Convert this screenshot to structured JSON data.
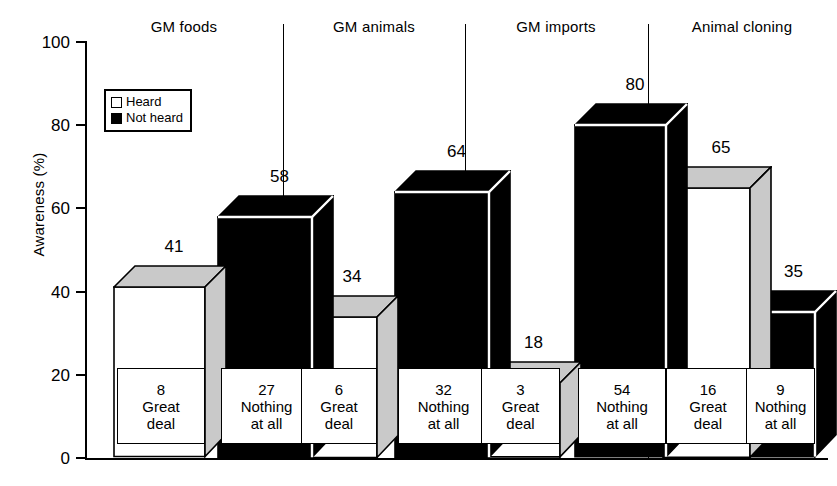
{
  "chart_data": {
    "type": "bar",
    "title": "",
    "xlabel": "",
    "ylabel": "Awareness (%)",
    "ylim": [
      0,
      100
    ],
    "yticks": [
      0,
      20,
      40,
      60,
      80,
      100
    ],
    "grid": false,
    "legend_position": "top-left",
    "style": "3d-bars",
    "legend": [
      {
        "key": "heard",
        "label": "Heard",
        "color": "#ffffff"
      },
      {
        "key": "notheard",
        "label": "Not heard",
        "color": "#000000"
      }
    ],
    "categories": [
      "GM foods",
      "GM animals",
      "GM imports",
      "Animal cloning"
    ],
    "series": [
      {
        "name": "Heard",
        "values": [
          41,
          34,
          18,
          65
        ]
      },
      {
        "name": "Not heard",
        "values": [
          58,
          64,
          80,
          35
        ]
      }
    ],
    "inner_labels": [
      {
        "value": 8,
        "line1": "Great",
        "line2": "deal"
      },
      {
        "value": 27,
        "line1": "Nothing",
        "line2": "at all"
      },
      {
        "value": 6,
        "line1": "Great",
        "line2": "deal"
      },
      {
        "value": 32,
        "line1": "Nothing",
        "line2": "at all"
      },
      {
        "value": 3,
        "line1": "Great",
        "line2": "deal"
      },
      {
        "value": 54,
        "line1": "Nothing",
        "line2": "at all"
      },
      {
        "value": 16,
        "line1": "Great",
        "line2": "deal"
      },
      {
        "value": 9,
        "line1": "Nothing",
        "line2": "at all"
      }
    ]
  },
  "axis": {
    "y_title": "Awareness (%)",
    "ticks": [
      "100",
      "80",
      "60",
      "40",
      "20",
      "0"
    ]
  },
  "groups": [
    {
      "title": "GM foods"
    },
    {
      "title": "GM animals"
    },
    {
      "title": "GM imports"
    },
    {
      "title": "Animal cloning"
    }
  ],
  "bar_values": {
    "b0": "41",
    "b1": "58",
    "b2": "34",
    "b3": "64",
    "b4": "18",
    "b5": "80",
    "b6": "65",
    "b7": "35"
  },
  "inner": {
    "i0": {
      "num": "8",
      "l1": "Great",
      "l2": "deal"
    },
    "i1": {
      "num": "27",
      "l1": "Nothing",
      "l2": "at all"
    },
    "i2": {
      "num": "6",
      "l1": "Great",
      "l2": "deal"
    },
    "i3": {
      "num": "32",
      "l1": "Nothing",
      "l2": "at all"
    },
    "i4": {
      "num": "3",
      "l1": "Great",
      "l2": "deal"
    },
    "i5": {
      "num": "54",
      "l1": "Nothing",
      "l2": "at all"
    },
    "i6": {
      "num": "16",
      "l1": "Great",
      "l2": "deal"
    },
    "i7": {
      "num": "9",
      "l1": "Nothing",
      "l2": "at all"
    }
  },
  "legend": {
    "heard": "Heard",
    "not_heard": "Not heard"
  },
  "colors": {
    "heard_front": "#ffffff",
    "heard_shade": "#c9c9c9",
    "notheard_front": "#000000",
    "outline": "#000000",
    "background": "#ffffff"
  }
}
